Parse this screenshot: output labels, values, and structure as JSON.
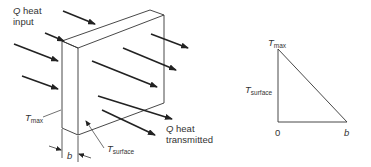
{
  "slab_figure": {
    "heat_input_label": {
      "symbol": "Q",
      "line1": "heat",
      "line2": "input"
    },
    "heat_transmitted_label": {
      "symbol": "Q",
      "line1": "heat",
      "line2": "transmitted"
    },
    "t_max_label": {
      "symbol": "T",
      "subscript": "max"
    },
    "t_surface_label": {
      "symbol": "T",
      "subscript": "surface"
    },
    "thickness_label": "b"
  },
  "profile_graph": {
    "t_max_label": {
      "symbol": "T",
      "subscript": "max"
    },
    "t_surface_label": {
      "symbol": "T",
      "subscript": "surface"
    },
    "origin_label": "0",
    "x_end_label": "b"
  },
  "colors": {
    "line": "#222222",
    "text": "#333333"
  }
}
